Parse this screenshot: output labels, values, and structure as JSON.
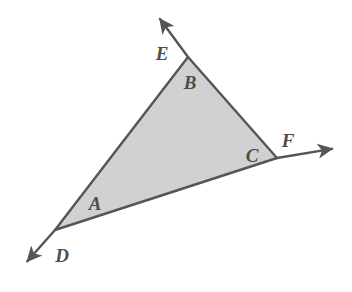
{
  "figure": {
    "kind": "geometry-diagram",
    "background_color": "#ffffff",
    "fill_color": "#d2d2d2",
    "stroke_color": "#555555",
    "label_color": "#4d4d4d",
    "stroke_width": 2.4,
    "canvas": {
      "width": 352,
      "height": 292
    }
  },
  "chart_data": {
    "type": "diagram",
    "title": "",
    "shape": "triangle-with-exterior-rays",
    "vertices": [
      {
        "name": "left-vertex",
        "x": 55,
        "y": 230,
        "interior_label": "A",
        "exterior_label": "D"
      },
      {
        "name": "top-vertex",
        "x": 188,
        "y": 57,
        "interior_label": "B",
        "exterior_label": "E"
      },
      {
        "name": "right-vertex",
        "x": 277,
        "y": 158,
        "interior_label": "C",
        "exterior_label": "F"
      }
    ],
    "polygon_points": "55,230 188,57 277,158",
    "rays": [
      {
        "name": "ray-D",
        "from_x": 55,
        "from_y": 230,
        "to_x": 24,
        "to_y": 265,
        "arrow": "end"
      },
      {
        "name": "ray-E",
        "from_x": 188,
        "from_y": 57,
        "to_x": 157,
        "to_y": 15,
        "arrow": "end"
      },
      {
        "name": "ray-F",
        "from_x": 277,
        "from_y": 158,
        "to_x": 337,
        "to_y": 148,
        "arrow": "end"
      }
    ]
  },
  "labels": {
    "interior": [
      {
        "id": "A",
        "text": "A",
        "x": 95,
        "y": 203
      },
      {
        "id": "B",
        "text": "B",
        "x": 190,
        "y": 82
      },
      {
        "id": "C",
        "text": "C",
        "x": 252,
        "y": 155
      }
    ],
    "exterior": [
      {
        "id": "D",
        "text": "D",
        "x": 62,
        "y": 255
      },
      {
        "id": "E",
        "text": "E",
        "x": 162,
        "y": 53
      },
      {
        "id": "F",
        "text": "F",
        "x": 288,
        "y": 140
      }
    ]
  }
}
